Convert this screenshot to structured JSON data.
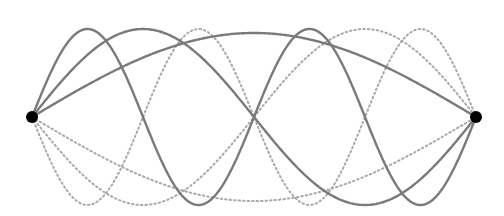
{
  "diagram": {
    "title": "",
    "endpoints": [
      {
        "x": 32,
        "y": 117,
        "r": 6
      },
      {
        "x": 476,
        "y": 117,
        "r": 6
      }
    ],
    "modes": [
      {
        "n": 1,
        "amplitude": 84
      },
      {
        "n": 2,
        "amplitude": 88
      },
      {
        "n": 4,
        "amplitude": 88
      }
    ],
    "colors": {
      "solid": "#7a7a7a",
      "dotted": "#a8a8a8",
      "endpoint": "#000000",
      "background": "#ffffff"
    }
  }
}
